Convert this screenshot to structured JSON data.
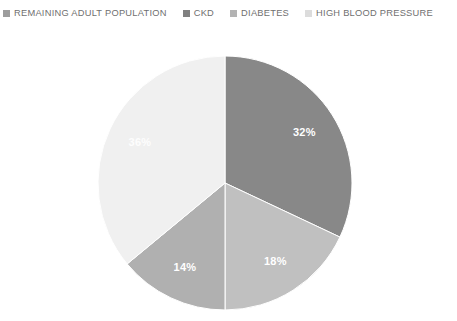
{
  "legend": {
    "position": "top",
    "items": [
      {
        "label": "REMAINING ADULT POPULATION",
        "color": "#9d9d9d",
        "swatch_icon": "square-swatch-icon"
      },
      {
        "label": "CKD",
        "color": "#808080",
        "swatch_icon": "square-swatch-icon"
      },
      {
        "label": "DIABETES",
        "color": "#b3b3b3",
        "swatch_icon": "square-swatch-icon"
      },
      {
        "label": "HIGH BLOOD PRESSURE",
        "color": "#dcdcdc",
        "swatch_icon": "square-swatch-icon"
      }
    ]
  },
  "chart_data": {
    "type": "pie",
    "title": "",
    "categories": [
      "CKD",
      "DIABETES",
      "HIGH BLOOD PRESSURE",
      "REMAINING ADULT POPULATION"
    ],
    "values": [
      32,
      18,
      14,
      36
    ],
    "labels": [
      "32%",
      "18%",
      "14%",
      "36%"
    ],
    "colors": [
      "#888888",
      "#c0c0c0",
      "#b0b0b0",
      "#f0f0f0"
    ],
    "units": "percent",
    "start_angle_deg": 0,
    "direction": "clockwise",
    "legend_position": "top",
    "grid": false,
    "slices": [
      {
        "name": "CKD",
        "value": 32,
        "label": "32%",
        "color": "#888888",
        "label_color": "#ffffff"
      },
      {
        "name": "DIABETES",
        "value": 18,
        "label": "18%",
        "color": "#c0c0c0",
        "label_color": "#ffffff"
      },
      {
        "name": "HIGH BLOOD PRESSURE",
        "value": 14,
        "label": "14%",
        "color": "#b0b0b0",
        "label_color": "#ffffff"
      },
      {
        "name": "REMAINING ADULT POPULATION",
        "value": 36,
        "label": "36%",
        "color": "#f0f0f0",
        "label_color": "#fdfdfd"
      }
    ]
  }
}
